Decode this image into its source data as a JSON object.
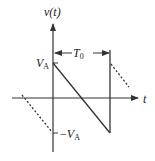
{
  "diagram": {
    "y_axis_label": "v(t)",
    "x_axis_label": "t",
    "period_label": {
      "main": "T",
      "sub": "0"
    },
    "top_level_label": {
      "main": "V",
      "sub": "A"
    },
    "bottom_level_label": {
      "prefix": "−",
      "main": "V",
      "sub": "A"
    },
    "colors": {
      "stroke": "#333333",
      "background": "#ffffff"
    }
  }
}
